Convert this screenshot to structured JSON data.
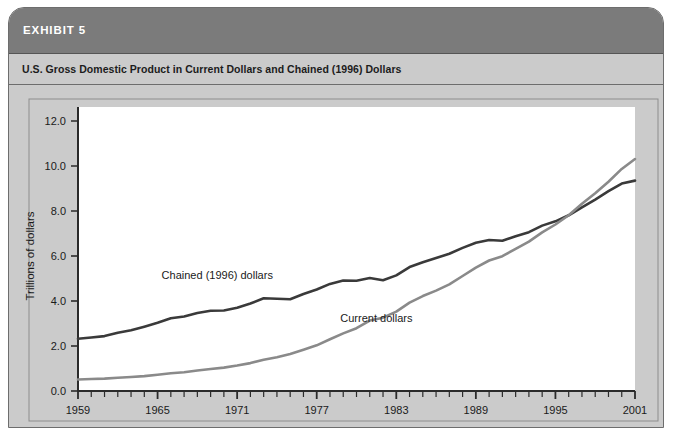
{
  "exhibit": {
    "label": "EXHIBIT 5",
    "subtitle": "U.S. Gross Domestic Product in Current Dollars and Chained (1996) Dollars"
  },
  "colors": {
    "card_background": "#cbcbcb",
    "header_band": "#7b7b7b",
    "header_text": "#ffffff",
    "plot_background": "#ffffff",
    "chained_line": "#3a3a3a",
    "current_line": "#8a8a8a",
    "axis": "#2a2a2a",
    "border": "#6d6d6d"
  },
  "chart_data": {
    "type": "line",
    "title": "U.S. Gross Domestic Product in Current Dollars and Chained (1996) Dollars",
    "xlabel": "",
    "ylabel": "Trillions of dollars",
    "xlim": [
      1959,
      2001
    ],
    "ylim": [
      0.0,
      12.0
    ],
    "ytick_labels": [
      "0.0",
      "2.0",
      "4.0",
      "6.0",
      "8.0",
      "10.0",
      "12.0"
    ],
    "yticks": [
      0.0,
      2.0,
      4.0,
      6.0,
      8.0,
      10.0,
      12.0
    ],
    "xtick_labels": [
      "1959",
      "1965",
      "1971",
      "1977",
      "1983",
      "1989",
      "1995",
      "2001"
    ],
    "xticks": [
      1959,
      1965,
      1971,
      1977,
      1983,
      1989,
      1995,
      2001
    ],
    "minor_xtick_step": 1,
    "grid": false,
    "legend_position": "inline-annotation",
    "annotations": [
      {
        "text": "Chained (1996) dollars",
        "x": 1969.5,
        "y": 5.0
      },
      {
        "text": "Current dollars",
        "x": 1981.5,
        "y": 3.05
      }
    ],
    "x": [
      1959,
      1960,
      1961,
      1962,
      1963,
      1964,
      1965,
      1966,
      1967,
      1968,
      1969,
      1970,
      1971,
      1972,
      1973,
      1974,
      1975,
      1976,
      1977,
      1978,
      1979,
      1980,
      1981,
      1982,
      1983,
      1984,
      1985,
      1986,
      1987,
      1988,
      1989,
      1990,
      1991,
      1992,
      1993,
      1994,
      1995,
      1996,
      1997,
      1998,
      1999,
      2000,
      2001
    ],
    "series": [
      {
        "name": "Chained (1996) dollars",
        "color": "#3a3a3a",
        "values": [
          2.32,
          2.38,
          2.44,
          2.59,
          2.7,
          2.86,
          3.03,
          3.23,
          3.31,
          3.47,
          3.57,
          3.58,
          3.7,
          3.89,
          4.12,
          4.1,
          4.08,
          4.31,
          4.51,
          4.76,
          4.91,
          4.9,
          5.02,
          4.92,
          5.14,
          5.51,
          5.72,
          5.91,
          6.1,
          6.36,
          6.59,
          6.71,
          6.68,
          6.88,
          7.06,
          7.35,
          7.54,
          7.81,
          8.16,
          8.51,
          8.88,
          9.22,
          9.35
        ]
      },
      {
        "name": "Current dollars",
        "color": "#8a8a8a",
        "values": [
          0.51,
          0.53,
          0.55,
          0.59,
          0.62,
          0.66,
          0.72,
          0.79,
          0.83,
          0.91,
          0.98,
          1.04,
          1.13,
          1.24,
          1.39,
          1.5,
          1.64,
          1.83,
          2.03,
          2.3,
          2.56,
          2.79,
          3.13,
          3.26,
          3.53,
          3.93,
          4.22,
          4.46,
          4.74,
          5.11,
          5.48,
          5.8,
          5.99,
          6.32,
          6.64,
          7.05,
          7.4,
          7.81,
          8.32,
          8.79,
          9.3,
          9.87,
          10.31
        ]
      }
    ]
  }
}
